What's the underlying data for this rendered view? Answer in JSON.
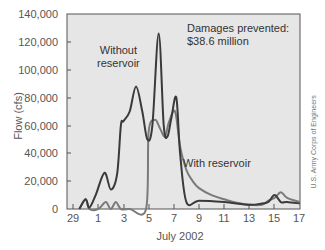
{
  "chart_data": {
    "type": "line",
    "title": "",
    "xlabel": "July 2002",
    "ylabel": "Flow (cfs)",
    "ylim": [
      0,
      140000
    ],
    "y_ticks": [
      "140,000",
      "120,000",
      "100,000",
      "80,000",
      "60,000",
      "40,000",
      "20,000",
      "0"
    ],
    "x_ticks": [
      "29",
      "1",
      "3",
      "5",
      "7",
      "9",
      "11",
      "13",
      "15",
      "17"
    ],
    "grid": false,
    "annotation": {
      "line1": "Damages prevented:",
      "line2": "$38.6 million"
    },
    "series": [
      {
        "name": "Without reservoir",
        "label_line1": "Without",
        "label_line2": "reservoir",
        "color": "#3a3a3a",
        "x": [
          29.5,
          30,
          30.3,
          30.8,
          31.5,
          32,
          32.5,
          32.8,
          33,
          33.5,
          34,
          34.5,
          34.9,
          35.3,
          35.8,
          36.2,
          36.5,
          36.8,
          37.2,
          37.5,
          38,
          39,
          41,
          43,
          44,
          44.5,
          45,
          45.5,
          46,
          47
        ],
        "y": [
          0,
          7000,
          1000,
          10000,
          26000,
          14000,
          25000,
          60000,
          63000,
          70000,
          88000,
          70000,
          50000,
          60000,
          126000,
          60000,
          52000,
          65000,
          80000,
          40000,
          5000,
          6000,
          5000,
          3000,
          4000,
          5000,
          10000,
          5000,
          5000,
          4000
        ]
      },
      {
        "name": "With reservoir",
        "label": "With reservoir",
        "color": "#7a7a7a",
        "x": [
          29.5,
          30,
          30.3,
          31,
          31.6,
          32,
          32.4,
          32.8,
          33.5,
          34.8,
          35,
          35.5,
          35.9,
          36.3,
          36.6,
          37.1,
          37.5,
          38,
          38.5,
          39,
          40,
          41,
          42,
          43,
          44,
          44.5,
          45,
          45.5,
          46,
          47
        ],
        "y": [
          0,
          7000,
          0,
          0,
          5000,
          0,
          5000,
          0,
          0,
          0,
          55000,
          64000,
          58000,
          52000,
          62000,
          70000,
          45000,
          28000,
          20000,
          15000,
          10000,
          7000,
          4500,
          3000,
          3000,
          6000,
          8000,
          12000,
          8000,
          5000
        ]
      }
    ]
  },
  "credit": "U.S. Army Corps of Engineers"
}
